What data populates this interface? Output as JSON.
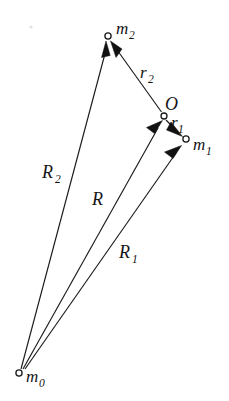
{
  "figure": {
    "background_color": "#ffffff",
    "ink_color": "#141414",
    "width": 229,
    "height": 401
  },
  "nodes": [
    {
      "id": "m0",
      "label": "m",
      "sub": "0",
      "x": 19,
      "y": 373,
      "label_x": 26,
      "label_y": 382,
      "sub_dx": 12,
      "sub_dy": 4
    },
    {
      "id": "m1",
      "label": "m",
      "sub": "1",
      "x": 186,
      "y": 140,
      "label_x": 193,
      "label_y": 150,
      "sub_dx": 12,
      "sub_dy": 4
    },
    {
      "id": "m2",
      "label": "m",
      "sub": "2",
      "x": 108,
      "y": 36,
      "label_x": 116,
      "label_y": 34,
      "sub_dx": 12,
      "sub_dy": 4
    },
    {
      "id": "O",
      "label": "O",
      "sub": "",
      "x": 164,
      "y": 116,
      "label_x": 166,
      "label_y": 109,
      "sub_dx": 0,
      "sub_dy": 0
    }
  ],
  "vectors": [
    {
      "id": "R2",
      "label": "R",
      "sub": "2",
      "from": "m0",
      "to": "m2",
      "x1": 21,
      "y1": 369,
      "x2": 106,
      "y2": 46,
      "label_x": 42,
      "label_y": 178,
      "sub_dx": 12,
      "sub_dy": 4,
      "description": "position vector from m0 to m2"
    },
    {
      "id": "R",
      "label": "R",
      "sub": "",
      "from": "m0",
      "to": "O",
      "x1": 23,
      "y1": 369,
      "x2": 157,
      "y2": 126,
      "label_x": 92,
      "label_y": 205,
      "sub_dx": 0,
      "sub_dy": 0,
      "description": "position vector from m0 to center O"
    },
    {
      "id": "R1",
      "label": "R",
      "sub": "1",
      "from": "m0",
      "to": "m1",
      "x1": 25,
      "y1": 369,
      "x2": 176,
      "y2": 152,
      "label_x": 119,
      "label_y": 258,
      "sub_dx": 12,
      "sub_dy": 4,
      "description": "position vector from m0 to m1"
    },
    {
      "id": "r2",
      "label": "r",
      "sub": "2",
      "from": "O",
      "to": "m2",
      "x1": 161,
      "y1": 112,
      "x2": 114,
      "y2": 45,
      "label_x": 140,
      "label_y": 78,
      "sub_dx": 8,
      "sub_dy": 4,
      "description": "relative vector from O to m2"
    },
    {
      "id": "r1",
      "label": "r",
      "sub": "1",
      "from": "O",
      "to": "m1",
      "x1": 166,
      "y1": 120,
      "x2": 180,
      "y2": 135,
      "label_x": 172,
      "label_y": 128,
      "sub_dx": 7,
      "sub_dy": 4,
      "description": "relative vector from O to m1"
    }
  ],
  "labels": {
    "m0": "m",
    "m0_sub": "0",
    "m1": "m",
    "m1_sub": "1",
    "m2": "m",
    "m2_sub": "2",
    "O": "O",
    "R": "R",
    "R1": "R",
    "R1_sub": "1",
    "R2": "R",
    "R2_sub": "2",
    "r1": "r",
    "r1_sub": "1",
    "r2": "r",
    "r2_sub": "2"
  }
}
